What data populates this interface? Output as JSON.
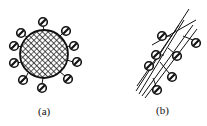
{
  "figure": {
    "panels": [
      {
        "id": "a",
        "label": "(a)",
        "description": "Cross-hatched spherical particle with ten small attached spheres around its perimeter"
      },
      {
        "id": "b",
        "label": "(b)",
        "description": "Bundle of crossing lines (fibrils) with seven small attached spheres"
      }
    ],
    "colors": {
      "stroke": "#111111",
      "background": "#ffffff"
    }
  }
}
